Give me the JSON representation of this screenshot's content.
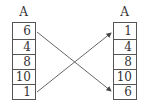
{
  "diagram": {
    "left_array": {
      "label": "A",
      "cells": [
        "6",
        "4",
        "8",
        "10",
        "1"
      ]
    },
    "right_array": {
      "label": "A",
      "cells": [
        "1",
        "4",
        "8",
        "10",
        "6"
      ]
    },
    "arrows": [
      {
        "from": "left index 0 (6)",
        "to": "right index 4 (6)"
      },
      {
        "from": "left index 4 (1)",
        "to": "right index 0 (1)"
      }
    ],
    "colors": {
      "stroke": "#555555",
      "text": "#333333"
    }
  }
}
